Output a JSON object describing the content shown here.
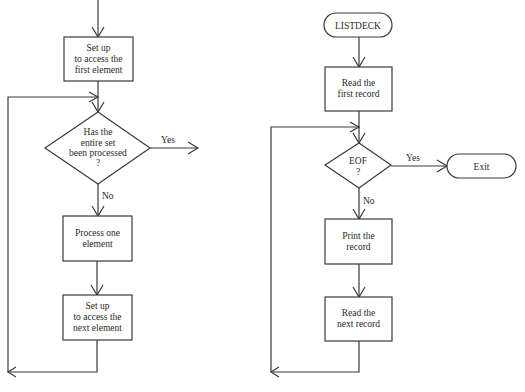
{
  "left_flowchart": {
    "box1": {
      "line1": "Set up",
      "line2": "to access the",
      "line3": "first element"
    },
    "decision": {
      "line1": "Has the",
      "line2": "entire set",
      "line3": "been processed",
      "line4": "?"
    },
    "yes_label": "Yes",
    "no_label": "No",
    "box2": {
      "line1": "Process one",
      "line2": "element"
    },
    "box3": {
      "line1": "Set up",
      "line2": "to access the",
      "line3": "next element"
    }
  },
  "right_flowchart": {
    "start_terminal": "LISTDECK",
    "box1": {
      "line1": "Read the",
      "line2": "first record"
    },
    "decision": {
      "line1": "EOF",
      "line2": "?"
    },
    "yes_label": "Yes",
    "no_label": "No",
    "exit_terminal": "Exit",
    "box2": {
      "line1": "Print the",
      "line2": "record"
    },
    "box3": {
      "line1": "Read the",
      "line2": "next record"
    }
  },
  "colors": {
    "line": "#3a3a3a",
    "text": "#2a2a2a",
    "background": "#ffffff"
  }
}
